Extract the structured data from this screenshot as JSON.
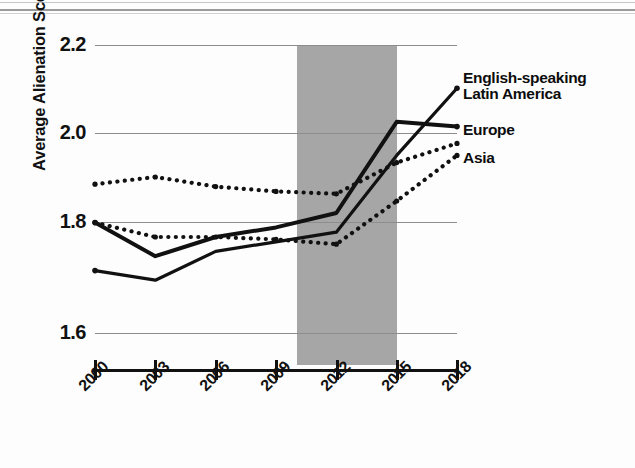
{
  "chart_data": {
    "type": "line",
    "title": "",
    "subtitle": "",
    "xlabel": "",
    "ylabel": "Average Alienation Scores",
    "x": [
      2000,
      2003,
      2006,
      2009,
      2012,
      2015,
      2018
    ],
    "xticklabels": [
      "2000",
      "2003",
      "2006",
      "2009",
      "2012",
      "2015",
      "2018"
    ],
    "yticklabels": [
      "2.2",
      "2.0",
      "1.8",
      "1.6"
    ],
    "yticks": [
      2.2,
      2.0,
      1.8,
      1.6
    ],
    "ylim": [
      1.55,
      2.2
    ],
    "xlim": [
      2000,
      2018
    ],
    "grid": "horizontal",
    "legend_position": "right-inline-annotations",
    "annotations": [
      {
        "name": "shaded-period",
        "x_start": 2010.5,
        "x_end": 2015,
        "color": "#a6a6a6",
        "label": ""
      }
    ],
    "series": [
      {
        "name": "English-speaking",
        "style": "solid",
        "color": "#111111",
        "values": [
          1.73,
          1.71,
          1.77,
          1.79,
          1.81,
          1.97,
          2.11
        ]
      },
      {
        "name": "Latin America",
        "style": "solid",
        "color": "#111111",
        "values": [
          1.83,
          1.76,
          1.8,
          1.82,
          1.85,
          2.04,
          2.03
        ]
      },
      {
        "name": "Europe",
        "style": "dotted",
        "color": "#111111",
        "values": [
          1.91,
          1.925,
          1.905,
          1.895,
          1.89,
          1.955,
          1.995
        ]
      },
      {
        "name": "Asia",
        "style": "dotted",
        "color": "#111111",
        "values": [
          1.83,
          1.8,
          1.8,
          1.795,
          1.785,
          1.875,
          1.97
        ]
      }
    ]
  },
  "axis": {
    "y_title": "Average Alienation Scores",
    "y_labels": [
      "2.2",
      "2.0",
      "1.8",
      "1.6"
    ],
    "x_labels": [
      "2000",
      "2003",
      "2006",
      "2009",
      "2012",
      "2015",
      "2018"
    ]
  },
  "series_labels": {
    "english_line1": "English-speaking",
    "english_line2": "Latin America",
    "europe": "Europe",
    "asia": "Asia"
  },
  "colors": {
    "line": "#111111",
    "grid": "#8d8d8d",
    "shade": "#a6a6a6",
    "page": "#fdfdfd",
    "text": "#111111"
  }
}
